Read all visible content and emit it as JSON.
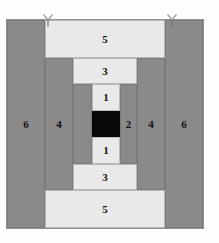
{
  "figure": {
    "canvas": {
      "width": 219,
      "height": 243,
      "background": "#fdfdfd"
    },
    "colors": {
      "gray": "#8a8a8a",
      "gray_border": "#7b7b7b",
      "light": "#e9e9e9",
      "light_border": "#b9b9b9",
      "black": "#0a0a0a",
      "frame_border": "#8f8f8f",
      "label_text": "#111111"
    },
    "markers": [
      {
        "name": "marker-left",
        "glyph": "Y",
        "x": 42,
        "y": 13
      },
      {
        "name": "marker-right",
        "glyph": "Y",
        "x": 166,
        "y": 13
      }
    ],
    "regions": [
      {
        "id": "outer-left-6",
        "label": "6",
        "fill": "gray",
        "x": 7,
        "y": 20,
        "w": 38,
        "h": 208
      },
      {
        "id": "outer-right-6",
        "label": "6",
        "fill": "gray",
        "x": 165,
        "y": 20,
        "w": 38,
        "h": 208
      },
      {
        "id": "top-band-5",
        "label": "5",
        "fill": "light",
        "x": 45,
        "y": 20,
        "w": 120,
        "h": 38
      },
      {
        "id": "bottom-band-5",
        "label": "5",
        "fill": "light",
        "x": 45,
        "y": 190,
        "w": 120,
        "h": 38
      },
      {
        "id": "mid-left-4",
        "label": "4",
        "fill": "gray",
        "x": 45,
        "y": 58,
        "w": 28,
        "h": 132
      },
      {
        "id": "mid-right-4",
        "label": "4",
        "fill": "gray",
        "x": 137,
        "y": 58,
        "w": 28,
        "h": 132
      },
      {
        "id": "top-band-3",
        "label": "3",
        "fill": "light",
        "x": 73,
        "y": 58,
        "w": 64,
        "h": 26
      },
      {
        "id": "bottom-band-3",
        "label": "3",
        "fill": "light",
        "x": 73,
        "y": 164,
        "w": 64,
        "h": 26
      },
      {
        "id": "inner-left-gray",
        "label": "",
        "fill": "gray",
        "x": 73,
        "y": 84,
        "w": 19,
        "h": 80
      },
      {
        "id": "inner-right-2",
        "label": "2",
        "fill": "gray",
        "x": 120,
        "y": 84,
        "w": 17,
        "h": 80
      },
      {
        "id": "top-core-1",
        "label": "1",
        "fill": "light",
        "x": 92,
        "y": 84,
        "w": 28,
        "h": 27
      },
      {
        "id": "bottom-core-1",
        "label": "1",
        "fill": "light",
        "x": 92,
        "y": 137,
        "w": 28,
        "h": 27
      },
      {
        "id": "center-black",
        "label": "",
        "fill": "black",
        "x": 92,
        "y": 111,
        "w": 28,
        "h": 26
      }
    ]
  }
}
